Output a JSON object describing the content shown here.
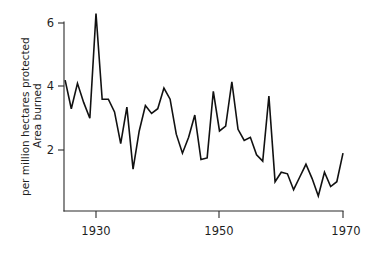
{
  "chart_data": {
    "type": "line",
    "title": "",
    "xlabel": "",
    "ylabel_line1": "Area burned",
    "ylabel_line2": "per million hectares protected",
    "xlim": [
      1925,
      1970
    ],
    "ylim": [
      0.4,
      6.4
    ],
    "grid": false,
    "legend": null,
    "x_ticks": [
      1930,
      1950,
      1970
    ],
    "x_tick_labels": [
      "1930",
      "1950",
      "1970"
    ],
    "y_ticks": [
      2,
      4,
      6
    ],
    "y_tick_labels": [
      "2",
      "4",
      "6"
    ],
    "line_color": "#111111",
    "axis_color": "#2b2b2b",
    "background_color": "#ffffff",
    "series": [
      {
        "name": "Area burned per million hectares protected",
        "x": [
          1925,
          1926,
          1927,
          1928,
          1929,
          1930,
          1931,
          1932,
          1933,
          1934,
          1935,
          1936,
          1937,
          1938,
          1939,
          1940,
          1941,
          1942,
          1943,
          1944,
          1945,
          1946,
          1947,
          1948,
          1949,
          1950,
          1951,
          1952,
          1953,
          1954,
          1955,
          1956,
          1957,
          1958,
          1959,
          1960,
          1961,
          1962,
          1963,
          1964,
          1965,
          1966,
          1967,
          1968,
          1969,
          1970
        ],
        "values": [
          4.2,
          3.3,
          4.1,
          3.5,
          3.0,
          6.3,
          3.6,
          3.6,
          3.2,
          2.2,
          3.35,
          1.4,
          2.6,
          3.4,
          3.15,
          3.3,
          3.95,
          3.6,
          2.5,
          1.9,
          2.4,
          3.1,
          1.7,
          1.75,
          3.85,
          2.6,
          2.75,
          4.15,
          2.65,
          2.3,
          2.4,
          1.85,
          1.65,
          3.7,
          1.0,
          1.3,
          1.25,
          0.75,
          1.15,
          1.55,
          1.1,
          0.55,
          1.3,
          0.85,
          1.0,
          1.9
        ]
      }
    ]
  },
  "axes": {
    "y_axis_label_line1": "Area burned",
    "y_axis_label_line2": "per million hectares protected"
  }
}
